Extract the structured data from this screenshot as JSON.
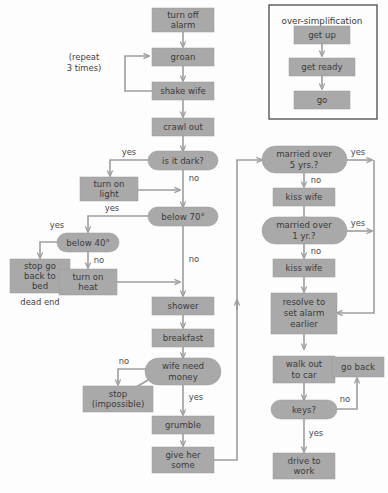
{
  "diagram": {
    "colors": {
      "node_fill": "#a9a9a9",
      "node_text": "#3a3a3a",
      "edge": "#9d9d9d",
      "edge_dark": "#3f3f3f",
      "background": "#fdfdfd",
      "inset_border": "#4a4a4a"
    },
    "nodes": {
      "turn_off_alarm": "turn off\nalarm",
      "turn_off_alarm_l1": "turn off",
      "turn_off_alarm_l2": "alarm",
      "groan": "groan",
      "shake_wife": "shake wife",
      "crawl_out": "crawl out",
      "is_it_dark": "is it dark?",
      "turn_on_light_l1": "turn on",
      "turn_on_light_l2": "light",
      "below_70": "below 70°",
      "below_40": "below 40°",
      "stop_go_back_l1": "stop go",
      "stop_go_back_l2": "back to",
      "stop_go_back_l3": "bed",
      "turn_on_heat_l1": "turn on",
      "turn_on_heat_l2": "heat",
      "shower": "shower",
      "breakfast": "breakfast",
      "wife_need_money_l1": "wife need",
      "wife_need_money_l2": "money",
      "stop_impossible_l1": "stop",
      "stop_impossible_l2": "(impossible)",
      "grumble": "grumble",
      "give_her_some_l1": "give her",
      "give_her_some_l2": "some",
      "married_5_l1": "married over",
      "married_5_l2": "5 yrs.?",
      "kiss_wife_1": "kiss wife",
      "married_1_l1": "married over",
      "married_1_l2": "1 yr.?",
      "kiss_wife_2": "kiss wife",
      "resolve_l1": "resolve to",
      "resolve_l2": "set alarm",
      "resolve_l3": "earlier",
      "walk_out_l1": "walk out",
      "walk_out_l2": "to car",
      "go_back": "go back",
      "keys": "keys?",
      "drive_to_work_l1": "drive to",
      "drive_to_work_l2": "work"
    },
    "notes": {
      "repeat_l1": "(repeat",
      "repeat_l2": "3 times)",
      "dead_end": "dead end"
    },
    "edge_labels": {
      "dark_yes": "yes",
      "dark_no": "no",
      "below70_yes": "yes",
      "below70_no": "no",
      "below40_yes": "yes",
      "below40_no": "no",
      "money_no": "no",
      "money_yes": "yes",
      "married5_yes": "yes",
      "married5_no": "no",
      "married1_yes": "yes",
      "married1_no": "no",
      "keys_no": "no",
      "keys_yes": "yes"
    },
    "inset": {
      "title": "over-simplification",
      "nodes": {
        "get_up": "get up",
        "get_ready": "get ready",
        "go": "go"
      }
    },
    "caption": ""
  }
}
